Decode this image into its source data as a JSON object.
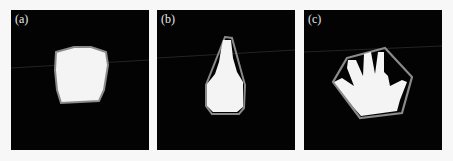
{
  "figure": {
    "panels": [
      {
        "label": "(a)",
        "subject": "convex blob segmentation with hull outline"
      },
      {
        "label": "(b)",
        "subject": "bottle-shaped segmentation with triangular hull outline"
      },
      {
        "label": "(c)",
        "subject": "hand segmentation with hexagonal convex hull outline"
      }
    ],
    "colors": {
      "background": "#030303",
      "mask": "#f4f4f4",
      "hull": "#8a8a8a",
      "page": "#f7f7f7"
    }
  }
}
